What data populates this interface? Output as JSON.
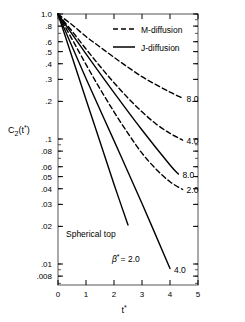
{
  "chart_data": {
    "type": "line",
    "title": "",
    "xlabel": "t*",
    "ylabel": "C2(t*)",
    "yscale": "log",
    "xlim": [
      0,
      5
    ],
    "ylim": [
      0.007,
      1.0
    ],
    "grid": false,
    "legend_position": "top-right",
    "annotations": [
      "Spherical top",
      "β* = 2.0"
    ],
    "legend": [
      {
        "name": "M-diffusion",
        "style": "dashed"
      },
      {
        "name": "J-diffusion",
        "style": "solid"
      }
    ],
    "xticks": [
      0,
      1,
      2,
      3,
      4,
      5
    ],
    "xtick_labels": [
      "0",
      "1",
      "2",
      "3",
      "4",
      "5"
    ],
    "yticks": [
      1.0,
      0.8,
      0.6,
      0.5,
      0.4,
      0.3,
      0.2,
      0.1,
      0.08,
      0.06,
      0.05,
      0.04,
      0.03,
      0.02,
      0.01,
      0.008
    ],
    "ytick_labels": [
      "1.0",
      ".8",
      ".6",
      ".5",
      ".4",
      ".3",
      ".2",
      ".1",
      ".08",
      ".06",
      ".05",
      ".04",
      ".03",
      ".02",
      ".01",
      ".008"
    ],
    "series": [
      {
        "name": "M-diffusion 8.0",
        "label": "8.0",
        "style": "dashed",
        "x": [
          0,
          0.5,
          1.0,
          1.5,
          2.0,
          2.5,
          3.0,
          3.5,
          4.0,
          4.45
        ],
        "y": [
          1.0,
          0.82,
          0.66,
          0.545,
          0.45,
          0.375,
          0.315,
          0.272,
          0.237,
          0.212
        ]
      },
      {
        "name": "M-diffusion 4.0",
        "label": "4.0",
        "style": "dashed",
        "x": [
          0,
          0.5,
          1.0,
          1.5,
          2.0,
          2.5,
          3.0,
          3.5,
          4.0,
          4.45
        ],
        "y": [
          1.0,
          0.73,
          0.525,
          0.382,
          0.282,
          0.213,
          0.165,
          0.132,
          0.111,
          0.098
        ]
      },
      {
        "name": "M-diffusion 2.0",
        "label": "2.0",
        "style": "dashed",
        "x": [
          0,
          0.5,
          1.0,
          1.5,
          2.0,
          2.5,
          3.0,
          3.5,
          4.0,
          4.45
        ],
        "y": [
          1.0,
          0.63,
          0.395,
          0.252,
          0.165,
          0.111,
          0.077,
          0.0575,
          0.0455,
          0.0395
        ]
      },
      {
        "name": "J-diffusion 8.0",
        "label": "8.0",
        "style": "solid",
        "x": [
          0,
          1.0,
          2.0,
          3.0,
          4.0,
          4.3
        ],
        "y": [
          1.0,
          0.48,
          0.235,
          0.118,
          0.062,
          0.0525
        ]
      },
      {
        "name": "J-diffusion 4.0",
        "label": "4.0",
        "style": "solid",
        "x": [
          0,
          1.0,
          2.0,
          3.0,
          4.0
        ],
        "y": [
          1.0,
          0.305,
          0.097,
          0.0305,
          0.0092
        ]
      },
      {
        "name": "J-diffusion 2.0",
        "label": "",
        "style": "solid",
        "x": [
          0,
          0.5,
          1.0,
          1.5,
          2.0,
          2.5
        ],
        "y": [
          1.0,
          0.455,
          0.207,
          0.095,
          0.0435,
          0.0205
        ]
      }
    ]
  },
  "legend": {
    "m_diffusion": "M-diffusion",
    "j_diffusion": "J-diffusion"
  },
  "annotations": {
    "spherical_top": "Spherical top",
    "beta_star": "β",
    "beta_sup": "*",
    "beta_value": "= 2.0"
  },
  "axes": {
    "ylabel_main": "C",
    "ylabel_sub": "2",
    "ylabel_paren_open": "(t",
    "ylabel_sup": "*",
    "ylabel_paren_close": ")",
    "xlabel_main": "t",
    "xlabel_sup": "*"
  },
  "curve_labels": {
    "m80": "8.0",
    "m40": "4.0",
    "j80": "8.0",
    "m20": "2.0",
    "j40": "4.0"
  }
}
